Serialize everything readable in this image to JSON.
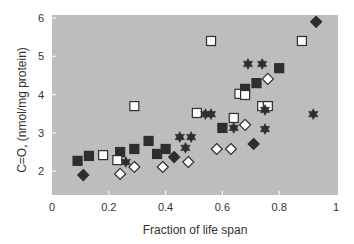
{
  "chart_data": {
    "type": "scatter",
    "title": "",
    "xlabel": "Fraction of life span",
    "ylabel": "C=O, (nmol/mg protein)",
    "xlim": [
      0,
      1
    ],
    "ylim": [
      1.4,
      6.1
    ],
    "x_ticks": [
      "0",
      "0.2",
      "0.4",
      "0.6",
      "0.8",
      "1"
    ],
    "x_tick_values": [
      0,
      0.2,
      0.4,
      0.6,
      0.8,
      1
    ],
    "y_ticks": [
      "2",
      "3",
      "4",
      "5",
      "6"
    ],
    "y_tick_values": [
      2,
      3,
      4,
      5,
      6
    ],
    "grid": false,
    "legend": null,
    "plot_background": "#bdbdbd",
    "series": [
      {
        "name": "filled-square",
        "marker": "square",
        "fill": "#2e2e2e",
        "stroke": "#2e2e2e",
        "points": [
          [
            0.09,
            2.27
          ],
          [
            0.13,
            2.4
          ],
          [
            0.24,
            2.5
          ],
          [
            0.29,
            2.58
          ],
          [
            0.34,
            2.79
          ],
          [
            0.37,
            2.45
          ],
          [
            0.4,
            2.58
          ],
          [
            0.6,
            3.13
          ],
          [
            0.68,
            4.15
          ],
          [
            0.72,
            4.3
          ],
          [
            0.8,
            4.69
          ]
        ]
      },
      {
        "name": "open-square",
        "marker": "square",
        "fill": "#ffffff",
        "stroke": "#2e2e2e",
        "points": [
          [
            0.18,
            2.42
          ],
          [
            0.23,
            2.29
          ],
          [
            0.29,
            3.7
          ],
          [
            0.51,
            3.52
          ],
          [
            0.56,
            5.4
          ],
          [
            0.64,
            3.39
          ],
          [
            0.66,
            4.02
          ],
          [
            0.68,
            3.99
          ],
          [
            0.74,
            3.7
          ],
          [
            0.76,
            3.7
          ],
          [
            0.88,
            5.4
          ]
        ]
      },
      {
        "name": "filled-diamond",
        "marker": "diamond",
        "fill": "#2e2e2e",
        "stroke": "#2e2e2e",
        "points": [
          [
            0.11,
            1.9
          ],
          [
            0.43,
            2.37
          ],
          [
            0.71,
            2.71
          ],
          [
            0.93,
            5.9
          ]
        ]
      },
      {
        "name": "open-diamond",
        "marker": "diamond",
        "fill": "#ffffff",
        "stroke": "#2e2e2e",
        "points": [
          [
            0.24,
            1.93
          ],
          [
            0.29,
            2.11
          ],
          [
            0.39,
            2.11
          ],
          [
            0.48,
            2.24
          ],
          [
            0.58,
            2.58
          ],
          [
            0.63,
            2.58
          ],
          [
            0.68,
            3.21
          ],
          [
            0.76,
            4.41
          ]
        ]
      },
      {
        "name": "star",
        "marker": "star",
        "fill": "#2e2e2e",
        "stroke": "#2e2e2e",
        "points": [
          [
            0.26,
            2.24
          ],
          [
            0.45,
            2.89
          ],
          [
            0.49,
            2.89
          ],
          [
            0.47,
            2.61
          ],
          [
            0.54,
            3.49
          ],
          [
            0.56,
            3.49
          ],
          [
            0.64,
            3.13
          ],
          [
            0.75,
            3.1
          ],
          [
            0.69,
            4.8
          ],
          [
            0.74,
            4.8
          ],
          [
            0.75,
            3.6
          ],
          [
            0.92,
            3.49
          ]
        ]
      }
    ]
  }
}
